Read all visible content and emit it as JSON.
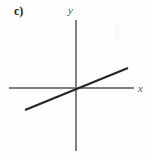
{
  "figure": {
    "part_label": "c)",
    "background_color": "#fefefe",
    "axis_color": "#808080",
    "line_color": "#262626"
  },
  "axes": {
    "x_label": "x",
    "y_label": "y",
    "x_axis": {
      "x1": 9,
      "y1": 88,
      "x2": 134,
      "y2": 88
    },
    "y_axis": {
      "x1": 76,
      "y1": 20,
      "x2": 76,
      "y2": 151
    }
  },
  "chart_data": {
    "type": "line",
    "title": "c)",
    "xlabel": "x",
    "ylabel": "y",
    "grid": false,
    "legend": null,
    "annotations": [],
    "origin": {
      "x": 76,
      "y": 88
    },
    "series": [
      {
        "name": "line",
        "points": [
          {
            "x": 25,
            "y": 110
          },
          {
            "x": 128,
            "y": 68
          }
        ],
        "slope": 0.41,
        "intercept": 0,
        "color": "#262626",
        "width": 2.2
      }
    ],
    "xlim": [
      -51,
      58
    ],
    "ylim": [
      -63,
      68
    ]
  }
}
